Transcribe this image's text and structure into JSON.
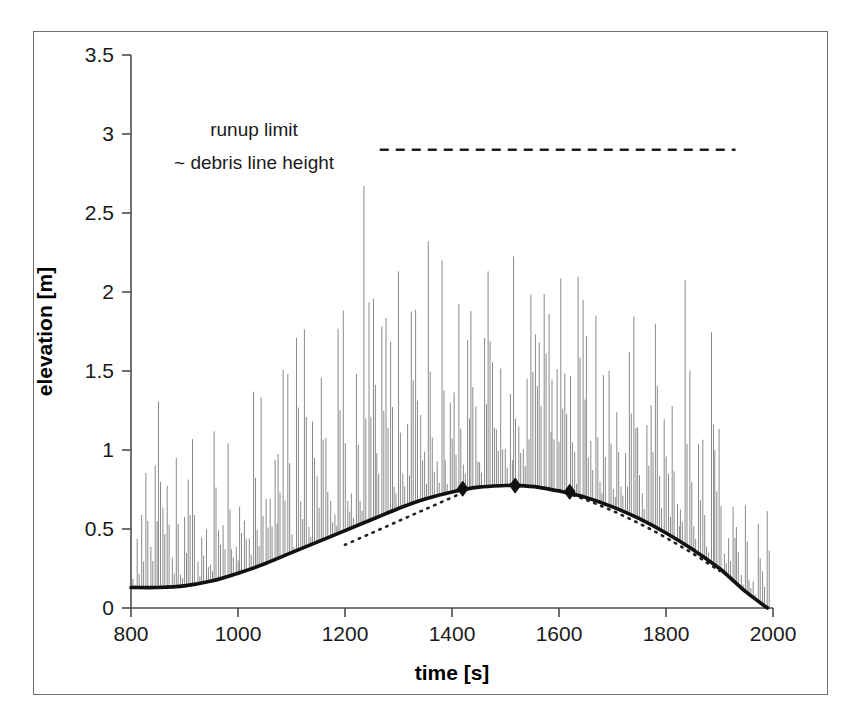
{
  "chart_data": {
    "type": "line",
    "title": "",
    "xlabel": "time [s]",
    "ylabel": "elevation [m]",
    "xlim": [
      800,
      2000
    ],
    "ylim": [
      0,
      3.5
    ],
    "xticks": [
      800,
      1000,
      1200,
      1400,
      1600,
      1800,
      2000
    ],
    "xtick_labels": [
      "800",
      "1000",
      "1200",
      "1400",
      "1600",
      "1800",
      "2000"
    ],
    "yticks": [
      0,
      0.5,
      1,
      1.5,
      2,
      2.5,
      3,
      3.5
    ],
    "ytick_labels": [
      "0",
      "0.5",
      "1",
      "1.5",
      "2",
      "2.5",
      "3",
      "3.5"
    ],
    "grid": false,
    "legend_position": "none",
    "annotations": [
      {
        "name": "runup-limit-label-line1",
        "text": "runup limit",
        "x": 1030,
        "y": 2.99
      },
      {
        "name": "runup-limit-label-line2",
        "text": "~ debris line height",
        "x": 1030,
        "y": 2.78
      }
    ],
    "series": [
      {
        "name": "runup-limit-line",
        "style": "dashed",
        "color": "#1a1a1a",
        "value": 2.9,
        "x_start": 1265,
        "x_end": 1930,
        "description": "horizontal dashed line marking runup limit / debris line height"
      },
      {
        "name": "tide-envelope",
        "style": "solid-thick",
        "color": "#111111",
        "description": "smooth tidal/setup curve forming lower envelope of swash oscillations",
        "x": [
          800,
          850,
          900,
          950,
          1000,
          1050,
          1100,
          1150,
          1200,
          1250,
          1300,
          1350,
          1400,
          1450,
          1500,
          1520,
          1560,
          1600,
          1650,
          1700,
          1750,
          1800,
          1850,
          1900,
          1950,
          1990
        ],
        "y": [
          0.13,
          0.13,
          0.14,
          0.17,
          0.22,
          0.28,
          0.35,
          0.42,
          0.49,
          0.56,
          0.63,
          0.69,
          0.735,
          0.765,
          0.775,
          0.775,
          0.765,
          0.74,
          0.7,
          0.64,
          0.565,
          0.475,
          0.37,
          0.25,
          0.1,
          0.0
        ]
      },
      {
        "name": "tangent-rising",
        "style": "dotted",
        "color": "#222222",
        "description": "dotted tangent under the rising limb",
        "x": [
          1200,
          1250,
          1300,
          1350,
          1400,
          1430
        ],
        "y": [
          0.4,
          0.475,
          0.55,
          0.625,
          0.7,
          0.745
        ]
      },
      {
        "name": "tangent-falling",
        "style": "dotted",
        "color": "#222222",
        "description": "dotted tangent along the falling limb",
        "x": [
          1600,
          1650,
          1700,
          1750,
          1800,
          1850,
          1900
        ],
        "y": [
          0.745,
          0.685,
          0.615,
          0.535,
          0.445,
          0.345,
          0.235
        ]
      },
      {
        "name": "swash-oscillations",
        "style": "spikes",
        "color": "#8a8a8a",
        "description": "dense thin vertical runup spikes rising from the tide envelope",
        "spike_max": 2.67,
        "spike_count": 150
      }
    ],
    "markers": [
      {
        "name": "diamond-marker-1",
        "x": 1420,
        "y": 0.755
      },
      {
        "name": "diamond-marker-2",
        "x": 1518,
        "y": 0.775
      },
      {
        "name": "diamond-marker-3",
        "x": 1620,
        "y": 0.735
      }
    ]
  }
}
